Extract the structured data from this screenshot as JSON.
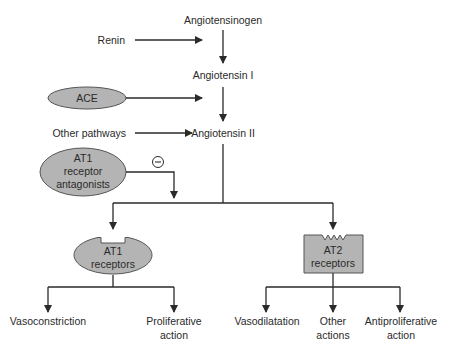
{
  "diagram": {
    "colors": {
      "node_fill": "#b4b4b4",
      "node_stroke": "#555555",
      "line": "#2a2a2a",
      "background": "#ffffff"
    },
    "cascade": {
      "angiotensinogen": "Angiotensinogen",
      "angiotensin_1": "Angiotensin I",
      "angiotensin_2": "Angiotensin II"
    },
    "inputs": {
      "renin": "Renin",
      "ace": "ACE",
      "other_pathways": "Other pathways",
      "at1_antagonists": [
        "AT1",
        "receptor",
        "antagonists"
      ],
      "inhibition_symbol": "−"
    },
    "receptors": {
      "at1": [
        "AT1",
        "receptors"
      ],
      "at2": [
        "AT2",
        "receptors"
      ]
    },
    "at1_effects": [
      {
        "lines": [
          "Vasoconstriction"
        ]
      },
      {
        "lines": [
          "Proliferative",
          "action"
        ]
      }
    ],
    "at2_effects": [
      {
        "lines": [
          "Vasodilatation"
        ]
      },
      {
        "lines": [
          "Other",
          "actions"
        ]
      },
      {
        "lines": [
          "Antiproliferative",
          "action"
        ]
      }
    ]
  }
}
